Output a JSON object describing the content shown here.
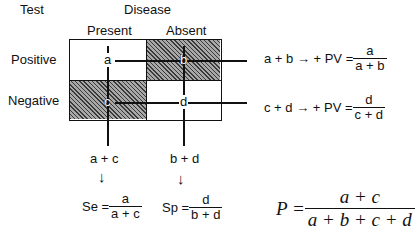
{
  "headers": {
    "test": "Test",
    "disease": "Disease",
    "present": "Present",
    "absent": "Absent",
    "positive": "Positive",
    "negative": "Negative"
  },
  "cells": {
    "a": "a",
    "b": "b",
    "c": "c",
    "d": "d"
  },
  "row_formulas": [
    {
      "lhs": "a + b → + PV =",
      "num": "a",
      "den": "a + b"
    },
    {
      "lhs": "c + d → + PV =",
      "num": "d",
      "den": "c + d"
    }
  ],
  "column_sums": [
    {
      "sum": "a + c",
      "arrow": "↓",
      "lhs": "Se =",
      "num": "a",
      "den": "a + c"
    },
    {
      "sum": "b + d",
      "arrow": "↓",
      "lhs": "Sp =",
      "num": "d",
      "den": "b + d"
    }
  ],
  "prevalence": {
    "lhs": "P =",
    "num": "a + c",
    "den": "a + b + c + d"
  },
  "colors": {
    "hatch_dark": "#3a3a3a",
    "hatch_light": "#a8a8a8",
    "line": "#111111"
  }
}
